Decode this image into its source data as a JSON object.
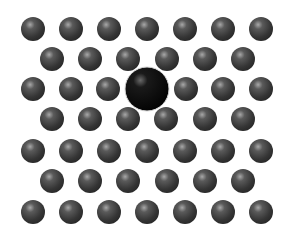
{
  "diagram": {
    "background": "#ffffff",
    "atom_color": "#3c3c3c",
    "atom_highlight": "#9a9a9a",
    "impurity_color": "#050505",
    "impurity_highlight": "#5a5a5a",
    "atom_radius": 12,
    "impurity": {
      "cx": 147,
      "cy": 89,
      "r": 22
    },
    "rows": [
      {
        "y": 29,
        "xs": [
          33,
          71,
          109,
          147,
          185,
          223,
          261
        ]
      },
      {
        "y": 59,
        "xs": [
          52,
          90,
          128,
          167,
          205,
          243
        ]
      },
      {
        "y": 89,
        "xs": [
          33,
          71,
          108,
          186,
          223,
          261
        ]
      },
      {
        "y": 119,
        "xs": [
          52,
          90,
          128,
          166,
          205,
          243
        ]
      },
      {
        "y": 151,
        "xs": [
          33,
          71,
          109,
          147,
          185,
          223,
          261
        ]
      },
      {
        "y": 181,
        "xs": [
          52,
          90,
          128,
          167,
          205,
          243
        ]
      },
      {
        "y": 212,
        "xs": [
          33,
          71,
          109,
          147,
          185,
          223,
          261
        ]
      }
    ]
  }
}
